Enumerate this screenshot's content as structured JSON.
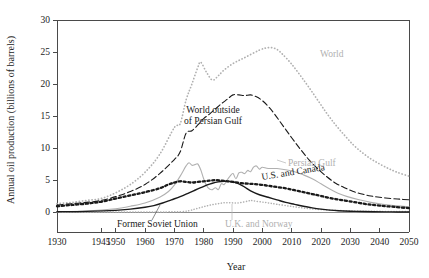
{
  "figure": {
    "background": "#ffffff",
    "plot_left": 57,
    "plot_right": 409,
    "plot_top": 20,
    "plot_bottom": 212,
    "axis_bottom": 232
  },
  "colors": {
    "black": "#1a1a1a",
    "gray": "#b0b0b0",
    "axis": "#4a4a4a",
    "baseline": "#8c8c8c"
  },
  "chart_data": {
    "type": "line",
    "title": "",
    "xlabel": "Year",
    "ylabel": "Annual oil production (billions of barrels)",
    "xlim": [
      1930,
      2050
    ],
    "ylim": [
      0,
      30
    ],
    "xticks": [
      1930,
      1945,
      1950,
      1960,
      1970,
      1980,
      1990,
      2000,
      2010,
      2020,
      2030,
      2040,
      2050
    ],
    "xtick_labels": [
      "1930",
      "1945",
      "1950",
      "1960",
      "1970",
      "1980",
      "1990",
      "2000",
      "2010",
      "2020",
      "2030",
      "2040",
      "2050"
    ],
    "yticks": [
      0,
      5,
      10,
      15,
      20,
      25,
      30
    ],
    "ytick_labels": [
      "0",
      "5",
      "10",
      "15",
      "20",
      "25",
      "30"
    ],
    "grid": false,
    "legend": "inline-annotations",
    "series": [
      {
        "name": "World",
        "label": "World",
        "color": "#b0b0b0",
        "style": "dotted",
        "stroke_width": 1.7,
        "dash": "0.2,3.0",
        "label_x": 320,
        "label_y": 57,
        "label_anchor": "start",
        "label_rotate": 0,
        "x": [
          1930,
          1935,
          1940,
          1945,
          1950,
          1955,
          1960,
          1965,
          1970,
          1972,
          1974,
          1976,
          1978,
          1979,
          1981,
          1983,
          1985,
          1987,
          1990,
          1993,
          1996,
          1999,
          2001,
          2003,
          2005,
          2007,
          2010,
          2013,
          2016,
          2019,
          2022,
          2025,
          2028,
          2031,
          2034,
          2037,
          2040,
          2043,
          2046,
          2050
        ],
        "y": [
          1.3,
          1.5,
          1.8,
          2.1,
          3.0,
          4.3,
          6.2,
          9.0,
          13.2,
          13.8,
          17.5,
          20.0,
          22.6,
          23.4,
          21.8,
          20.6,
          21.3,
          22.2,
          23.2,
          23.9,
          24.6,
          25.3,
          25.6,
          25.7,
          25.4,
          24.6,
          23.1,
          21.3,
          19.4,
          17.4,
          15.4,
          13.6,
          12.0,
          10.5,
          9.3,
          8.3,
          7.5,
          6.8,
          6.2,
          5.6
        ]
      },
      {
        "name": "World outside of Persian Gulf",
        "label_lines": [
          "World outside",
          "of Persian Gulf"
        ],
        "color": "#1a1a1a",
        "style": "dashed",
        "stroke_width": 1.1,
        "dash": "6,3",
        "label_x": 213,
        "label_y": 113,
        "label_anchor": "middle",
        "label_rotate": 0,
        "x": [
          1930,
          1935,
          1940,
          1945,
          1950,
          1955,
          1960,
          1965,
          1970,
          1972,
          1974,
          1976,
          1978,
          1980,
          1982,
          1984,
          1986,
          1988,
          1990,
          1992,
          1994,
          1996,
          1998,
          2000,
          2002,
          2004,
          2007,
          2010,
          2013,
          2016,
          2019,
          2022,
          2025,
          2028,
          2031,
          2034,
          2037,
          2040,
          2044,
          2047,
          2050
        ],
        "y": [
          1.1,
          1.3,
          1.5,
          1.8,
          2.4,
          3.2,
          4.3,
          6.0,
          8.2,
          9.4,
          12.3,
          12.7,
          13.6,
          14.6,
          15.3,
          16.1,
          16.9,
          17.6,
          18.3,
          18.3,
          18.2,
          18.3,
          18.0,
          17.4,
          16.5,
          15.4,
          13.5,
          11.6,
          9.8,
          8.1,
          6.7,
          5.5,
          4.5,
          3.8,
          3.2,
          2.8,
          2.5,
          2.3,
          2.1,
          2.0,
          1.9
        ]
      },
      {
        "name": "Persian Gulf",
        "label": "Persian Gulf",
        "color": "#b0b0b0",
        "style": "solid",
        "stroke_width": 1.1,
        "dash": "",
        "label_x": 288,
        "label_y": 166,
        "label_anchor": "start",
        "label_rotate": 0,
        "x": [
          1930,
          1940,
          1950,
          1955,
          1960,
          1965,
          1968,
          1970,
          1972,
          1974,
          1975,
          1976,
          1977,
          1978,
          1979,
          1980,
          1981,
          1982,
          1983,
          1984,
          1985,
          1986,
          1987,
          1988,
          1989,
          1990,
          1991,
          1992,
          1993,
          1994,
          1995,
          1996,
          1997,
          1998,
          1999,
          2000,
          2002,
          2005,
          2008,
          2011,
          2014,
          2017,
          2020,
          2023,
          2026,
          2029,
          2033,
          2037,
          2041,
          2045,
          2050
        ],
        "y": [
          0.05,
          0.15,
          0.5,
          0.9,
          1.4,
          2.3,
          3.2,
          4.2,
          5.6,
          7.2,
          7.7,
          7.3,
          7.4,
          7.5,
          6.6,
          5.2,
          4.1,
          3.6,
          3.5,
          3.8,
          3.5,
          4.4,
          4.3,
          5.0,
          5.6,
          6.0,
          5.2,
          6.1,
          6.2,
          6.0,
          6.5,
          6.3,
          7.0,
          7.2,
          6.7,
          7.0,
          6.8,
          6.8,
          6.6,
          6.3,
          5.8,
          5.2,
          4.4,
          3.6,
          2.9,
          2.4,
          1.9,
          1.5,
          1.2,
          1.0,
          0.8
        ]
      },
      {
        "name": "U.S. and Canada",
        "label": "U.S. and Canada",
        "color": "#1a1a1a",
        "style": "thick-dotted",
        "stroke_width": 2.3,
        "dash": "2.2,2.6",
        "label_x": 262,
        "label_y": 180,
        "label_anchor": "start",
        "label_rotate": -9,
        "x": [
          1930,
          1935,
          1940,
          1945,
          1950,
          1955,
          1960,
          1965,
          1968,
          1970,
          1972,
          1974,
          1976,
          1978,
          1980,
          1982,
          1984,
          1986,
          1988,
          1990,
          1993,
          1996,
          1999,
          2002,
          2005,
          2008,
          2011,
          2014,
          2017,
          2020,
          2024,
          2028,
          2032,
          2036,
          2040,
          2045,
          2050
        ],
        "y": [
          0.9,
          1.1,
          1.3,
          1.6,
          2.1,
          2.6,
          3.1,
          3.7,
          4.3,
          4.6,
          4.8,
          4.7,
          4.6,
          4.7,
          4.8,
          4.9,
          5.0,
          4.9,
          4.8,
          4.7,
          4.5,
          4.4,
          4.3,
          4.1,
          3.9,
          3.7,
          3.4,
          3.1,
          2.8,
          2.5,
          2.1,
          1.8,
          1.5,
          1.2,
          1.0,
          0.8,
          0.6
        ]
      },
      {
        "name": "U.K. and Norway",
        "label": "U.K. and Norway",
        "color": "#b0b0b0",
        "style": "dotted",
        "stroke_width": 1.5,
        "dash": "0.2,2.6",
        "label_x": 225,
        "label_y": 227,
        "label_anchor": "start",
        "label_rotate": 0,
        "x": [
          1930,
          1960,
          1968,
          1972,
          1975,
          1977,
          1979,
          1981,
          1983,
          1985,
          1987,
          1989,
          1991,
          1993,
          1995,
          1996,
          1997,
          1999,
          2001,
          2003,
          2005,
          2008,
          2011,
          2014,
          2017,
          2020,
          2024,
          2028,
          2032,
          2036,
          2040,
          2045,
          2050
        ],
        "y": [
          0.0,
          0.0,
          0.02,
          0.05,
          0.2,
          0.45,
          0.7,
          0.95,
          1.15,
          1.3,
          1.45,
          1.45,
          1.4,
          1.5,
          1.7,
          1.8,
          1.75,
          1.6,
          1.5,
          1.35,
          1.2,
          1.0,
          0.8,
          0.62,
          0.48,
          0.38,
          0.28,
          0.2,
          0.15,
          0.12,
          0.1,
          0.08,
          0.06
        ]
      },
      {
        "name": "Former Soviet Union",
        "label": "Former Soviet Union",
        "color": "#1a1a1a",
        "style": "solid",
        "stroke_width": 1.4,
        "dash": "",
        "label_x": 117,
        "label_y": 227,
        "label_anchor": "start",
        "label_rotate": 0,
        "x": [
          1930,
          1940,
          1950,
          1955,
          1960,
          1963,
          1966,
          1969,
          1972,
          1975,
          1977,
          1979,
          1981,
          1983,
          1985,
          1987,
          1988,
          1990,
          1992,
          1994,
          1996,
          1999,
          2002,
          2005,
          2008,
          2011,
          2014,
          2017,
          2020,
          2023,
          2026,
          2030,
          2034,
          2038,
          2042,
          2046,
          2050
        ],
        "y": [
          0.05,
          0.1,
          0.25,
          0.45,
          0.75,
          1.0,
          1.4,
          1.9,
          2.4,
          3.0,
          3.4,
          3.8,
          4.2,
          4.5,
          4.7,
          4.8,
          4.8,
          4.7,
          4.4,
          3.9,
          3.3,
          2.7,
          2.3,
          1.9,
          1.5,
          1.2,
          0.9,
          0.65,
          0.45,
          0.3,
          0.2,
          0.12,
          0.07,
          0.04,
          0.02,
          0.01,
          0.0
        ]
      }
    ],
    "leaders": [
      {
        "name": "leader-former-soviet-union",
        "color": "#5a5a5a",
        "x1": 152,
        "y1": 220,
        "x2": 160,
        "y2": 205
      },
      {
        "name": "leader-uk-and-norway",
        "color": "#b4b4b4",
        "x1": 232,
        "y1": 220,
        "x2": 232,
        "y2": 204
      },
      {
        "name": "leader-persian-gulf",
        "color": "#b4b4b4",
        "x1": 286,
        "y1": 163,
        "x2": 277,
        "y2": 160
      }
    ]
  }
}
